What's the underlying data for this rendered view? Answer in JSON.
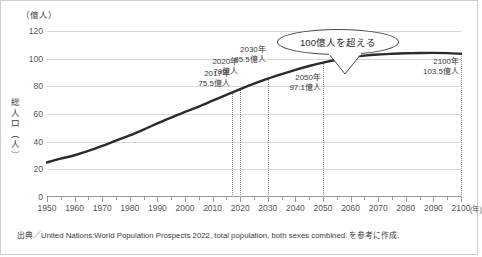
{
  "chart_data": {
    "type": "line",
    "title": "",
    "subtitle": "",
    "xlabel": "年",
    "ylabel": "総人口（人）",
    "yunit": "（億人）",
    "xunit": "(年)",
    "xlim": [
      1950,
      2100
    ],
    "ylim": [
      0,
      120
    ],
    "y_ticks": [
      0,
      20,
      40,
      60,
      80,
      100,
      120
    ],
    "x_ticks": [
      1950,
      1960,
      1970,
      1980,
      1990,
      2000,
      2010,
      2020,
      2030,
      2040,
      2050,
      2060,
      2070,
      2080,
      2090,
      2100
    ],
    "x_minor_step": 5,
    "grid": "horizontal",
    "legend": "none",
    "series": [
      {
        "name": "世界総人口",
        "color": "#2b2b2b",
        "x": [
          1950,
          1955,
          1960,
          1965,
          1970,
          1975,
          1980,
          1985,
          1990,
          1995,
          2000,
          2005,
          2010,
          2015,
          2017,
          2020,
          2025,
          2030,
          2035,
          2040,
          2045,
          2050,
          2055,
          2060,
          2065,
          2070,
          2075,
          2080,
          2085,
          2090,
          2095,
          2100
        ],
        "values": [
          25.0,
          27.7,
          30.2,
          33.3,
          36.9,
          40.8,
          44.5,
          48.7,
          53.2,
          57.4,
          61.5,
          65.4,
          69.6,
          73.8,
          75.5,
          78.0,
          81.9,
          85.5,
          88.8,
          91.9,
          94.7,
          97.1,
          99.2,
          100.9,
          102.2,
          103.0,
          103.5,
          103.9,
          104.1,
          104.2,
          104.0,
          103.5
        ]
      }
    ],
    "annotations": [
      {
        "year": 2017,
        "value": 75.5,
        "year_label": "2017年",
        "value_label": "75.5億人"
      },
      {
        "year": 2020,
        "value": 78.0,
        "year_label": "2020年",
        "value_label": "78億人"
      },
      {
        "year": 2030,
        "value": 85.5,
        "year_label": "2030年",
        "value_label": "85.5億人"
      },
      {
        "year": 2050,
        "value": 97.1,
        "year_label": "2050年",
        "value_label": "97.1億人"
      },
      {
        "year": 2100,
        "value": 103.5,
        "year_label": "2100年",
        "value_label": "103.5億人"
      }
    ],
    "callout": {
      "text": "100億人を超える",
      "points_to_year": 2058,
      "points_to_value": 100.5
    },
    "source": "出典／United Nations:World Population Prospects 2022, total population, both sexes combined. を参考に作成."
  }
}
